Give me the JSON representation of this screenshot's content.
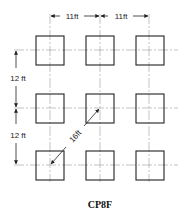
{
  "diagram": {
    "caption": "CP8F",
    "grid": {
      "rows": 3,
      "cols": 3
    },
    "dimensions": {
      "horizontal_spacing_1": "11ft",
      "horizontal_spacing_2": "11ft",
      "vertical_spacing_1": "12 ft",
      "vertical_spacing_2": "12 ft",
      "diagonal_spacing": "16ft"
    },
    "colors": {
      "line": "#222222",
      "centerline": "#9a9a9a",
      "background": "#ffffff"
    }
  }
}
